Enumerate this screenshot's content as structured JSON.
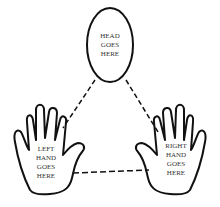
{
  "head": {
    "line1": "HEAD",
    "line2": "GOES",
    "line3": "HERE"
  },
  "left_hand": {
    "line1": "LEFT",
    "line2": "HAND",
    "line3": "GOES",
    "line4": "HERE"
  },
  "right_hand": {
    "line1": "RIGHT",
    "line2": "HAND",
    "line3": "GOES",
    "line4": "HERE"
  },
  "colors": {
    "stroke": "#111111",
    "background": "#ffffff"
  }
}
